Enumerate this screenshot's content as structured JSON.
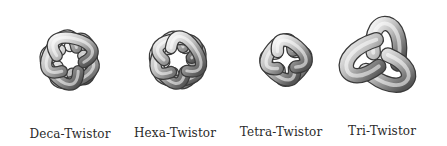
{
  "figure": {
    "items": [
      {
        "id": "deca",
        "label": "Deca-Twistor",
        "lobes": 10
      },
      {
        "id": "hexa",
        "label": "Hexa-Twistor",
        "lobes": 6
      },
      {
        "id": "tetra",
        "label": "Tetra-Twistor",
        "lobes": 4
      },
      {
        "id": "tri",
        "label": "Tri-Twistor",
        "lobes": 3
      }
    ]
  }
}
